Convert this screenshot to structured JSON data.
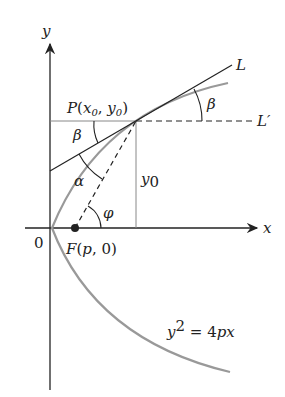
{
  "diagram": {
    "axes": {
      "x_label": "x",
      "y_label": "y",
      "origin_label": "0"
    },
    "point_P": {
      "name": "P",
      "coords": "(x0, y0)"
    },
    "focus": {
      "name": "F",
      "coords": "(p, 0)"
    },
    "lines": {
      "tangent": "L",
      "horizontal": "L′"
    },
    "angles": {
      "beta": "β",
      "alpha": "α",
      "phi": "φ"
    },
    "segment_label": "y0",
    "curve_equation": "y² = 4px",
    "colors": {
      "curve": "#999999",
      "lines": "#222222"
    }
  }
}
